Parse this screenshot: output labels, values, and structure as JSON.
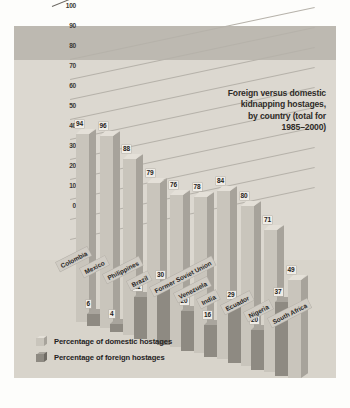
{
  "chart_data": {
    "type": "bar",
    "title": "Foreign versus domestic kidnapping hostages, by country (total for 1985–2000)",
    "title_lines": [
      "Foreign versus domestic",
      "kidnapping hostages,",
      "by country (total for",
      "1985–2000)"
    ],
    "xlabel": "",
    "ylabel": "",
    "ylim": [
      0,
      100
    ],
    "yticks": [
      0,
      10,
      20,
      30,
      40,
      50,
      60,
      70,
      80,
      90,
      100
    ],
    "grid": true,
    "legend_position": "bottom-left",
    "categories": [
      "Colombia",
      "Mexico",
      "Philippines",
      "Brazil",
      "Former Soviet Union",
      "Venezuela",
      "India",
      "Ecuador",
      "Nigeria",
      "South Africa"
    ],
    "series": [
      {
        "name": "Percentage of domestic hostages",
        "color": "#c9c5bc",
        "values": [
          94,
          96,
          88,
          79,
          76,
          78,
          84,
          80,
          71,
          49
        ]
      },
      {
        "name": "Percentage of foreign hostages",
        "color": "#8e8a82",
        "values": [
          6,
          4,
          21,
          30,
          20,
          16,
          29,
          20,
          37,
          null
        ]
      }
    ]
  },
  "legend": {
    "items": [
      {
        "label": "Percentage of domestic hostages"
      },
      {
        "label": "Percentage of foreign hostages"
      }
    ]
  },
  "colors": {
    "plate": "#dedad2",
    "top_band": "#bdb9b1",
    "domestic": "#c9c5bc",
    "foreign": "#8e8a82",
    "text": "#26241f"
  }
}
